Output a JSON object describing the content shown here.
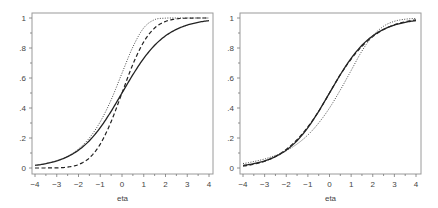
{
  "chart_data": [
    {
      "type": "line",
      "title": "",
      "xlabel": "eta",
      "ylabel": "",
      "xlim": [
        -4,
        4
      ],
      "ylim": [
        0,
        1
      ],
      "x_ticks": [
        "-4",
        "-3",
        "-2",
        "-1",
        "0",
        "1",
        "2",
        "3",
        "4"
      ],
      "y_ticks": [
        "0",
        ".2",
        ".4",
        ".6",
        ".8",
        "1"
      ],
      "grid": false,
      "legend": null,
      "x": [
        -4,
        -3.5,
        -3,
        -2.5,
        -2,
        -1.5,
        -1,
        -0.5,
        0,
        0.5,
        1,
        1.5,
        2,
        2.5,
        3,
        3.5,
        4
      ],
      "series": [
        {
          "name": "solid",
          "style": "solid",
          "values": [
            0.018,
            0.029,
            0.047,
            0.076,
            0.119,
            0.182,
            0.269,
            0.378,
            0.5,
            0.622,
            0.731,
            0.818,
            0.881,
            0.924,
            0.953,
            0.971,
            0.982
          ]
        },
        {
          "name": "dashed",
          "style": "dashed",
          "values": [
            0.0,
            0.0002,
            0.001,
            0.006,
            0.023,
            0.067,
            0.159,
            0.309,
            0.5,
            0.691,
            0.841,
            0.933,
            0.977,
            0.994,
            0.999,
            1.0,
            1.0
          ]
        },
        {
          "name": "dotted",
          "style": "dotted",
          "values": [
            0.018,
            0.03,
            0.049,
            0.079,
            0.127,
            0.2,
            0.308,
            0.454,
            0.632,
            0.807,
            0.934,
            0.989,
            0.999,
            1.0,
            1.0,
            1.0,
            1.0
          ]
        }
      ]
    },
    {
      "type": "line",
      "title": "",
      "xlabel": "eta",
      "ylabel": "",
      "xlim": [
        -4,
        4
      ],
      "ylim": [
        0,
        1
      ],
      "x_ticks": [
        "-4",
        "-3",
        "-2",
        "-1",
        "0",
        "1",
        "2",
        "3",
        "4"
      ],
      "y_ticks": [
        "0",
        ".2",
        ".4",
        ".6",
        ".8",
        "1"
      ],
      "grid": false,
      "legend": null,
      "x": [
        -4,
        -3.5,
        -3,
        -2.5,
        -2,
        -1.5,
        -1,
        -0.5,
        0,
        0.5,
        1,
        1.5,
        2,
        2.5,
        3,
        3.5,
        4
      ],
      "series": [
        {
          "name": "solid",
          "style": "solid",
          "values": [
            0.018,
            0.029,
            0.047,
            0.076,
            0.119,
            0.182,
            0.269,
            0.378,
            0.5,
            0.622,
            0.731,
            0.818,
            0.881,
            0.924,
            0.953,
            0.971,
            0.982
          ]
        },
        {
          "name": "dashed",
          "style": "dashed",
          "values": [
            0.013,
            0.025,
            0.045,
            0.077,
            0.124,
            0.189,
            0.274,
            0.378,
            0.5,
            0.622,
            0.726,
            0.811,
            0.876,
            0.923,
            0.955,
            0.975,
            0.987
          ]
        },
        {
          "name": "dotted",
          "style": "dotted",
          "values": [
            0.03,
            0.043,
            0.06,
            0.084,
            0.115,
            0.16,
            0.22,
            0.3,
            0.4,
            0.52,
            0.65,
            0.78,
            0.88,
            0.945,
            0.978,
            0.992,
            0.997
          ]
        }
      ]
    }
  ]
}
